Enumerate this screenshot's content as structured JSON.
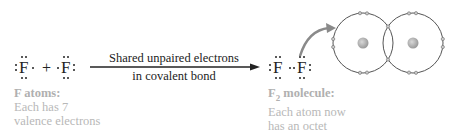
{
  "reactants": {
    "atom1_symbol": "F",
    "plus": "+",
    "atom2_symbol": "F"
  },
  "reaction_arrow": {
    "line1": "Shared unpaired electrons",
    "line2": "in covalent bond"
  },
  "product": {
    "atom1_symbol": "F",
    "atom2_symbol": "F"
  },
  "captions": {
    "reactants": {
      "title": "F atoms:",
      "line1": "Each has 7",
      "line2": "valence electrons"
    },
    "product": {
      "title_prefix": "F",
      "title_subscript": "2",
      "title_suffix": " molecule:",
      "line1": "Each atom now",
      "line2": "has an octet"
    }
  },
  "orbital_diagram": {
    "left_atom": {
      "cx": 363,
      "cy": 43,
      "r": 30
    },
    "right_atom": {
      "cx": 413,
      "cy": 43,
      "r": 30
    },
    "colors": {
      "orbit": "#555555",
      "nucleus": "#aaaaaa",
      "electron": "#999999",
      "arrow": "#888888"
    }
  }
}
